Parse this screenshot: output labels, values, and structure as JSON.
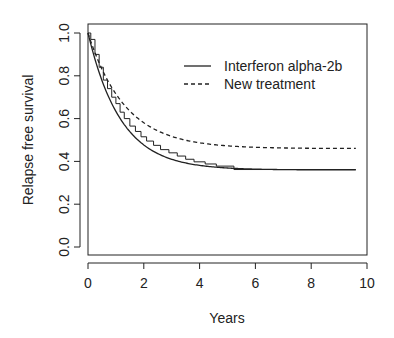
{
  "chart_data": {
    "type": "line",
    "title": "",
    "xlabel": "Years",
    "ylabel": "Relapse free survival",
    "xlim": [
      0,
      10
    ],
    "ylim": [
      0,
      1
    ],
    "x_ticks": [
      0,
      2,
      4,
      6,
      8,
      10
    ],
    "x_tick_labels": [
      "0",
      "2",
      "4",
      "6",
      "8",
      "10"
    ],
    "y_ticks": [
      0.0,
      0.2,
      0.4,
      0.6,
      0.8,
      1.0
    ],
    "y_tick_labels": [
      "0.0",
      "0.2",
      "0.4",
      "0.6",
      "0.8",
      "1.0"
    ],
    "grid": false,
    "legend_position": "top-right inside",
    "series": [
      {
        "name": "Interferon alpha-2b",
        "style": "solid",
        "model": "cure",
        "cure_fraction": 0.36,
        "rate": 0.85,
        "x": [
          0,
          1,
          2,
          3,
          4,
          5,
          6,
          7,
          8,
          9,
          9.6
        ],
        "values": [
          1.0,
          0.634,
          0.47,
          0.41,
          0.381,
          0.369,
          0.364,
          0.362,
          0.36,
          0.36,
          0.36
        ]
      },
      {
        "name": "New treatment",
        "style": "dashed",
        "model": "cure",
        "cure_fraction": 0.46,
        "rate": 0.75,
        "x": [
          0,
          1,
          2,
          3,
          4,
          5,
          6,
          7,
          8,
          9,
          9.6
        ],
        "values": [
          1.0,
          0.715,
          0.58,
          0.517,
          0.487,
          0.472,
          0.466,
          0.463,
          0.461,
          0.46,
          0.46
        ]
      },
      {
        "name": "Interferon alpha-2b (Kaplan-Meier)",
        "style": "step",
        "steps": [
          [
            0.0,
            1.0
          ],
          [
            0.1,
            0.97
          ],
          [
            0.25,
            0.9
          ],
          [
            0.4,
            0.84
          ],
          [
            0.55,
            0.78
          ],
          [
            0.7,
            0.74
          ],
          [
            0.85,
            0.7
          ],
          [
            1.0,
            0.67
          ],
          [
            1.15,
            0.63
          ],
          [
            1.3,
            0.6
          ],
          [
            1.5,
            0.565
          ],
          [
            1.7,
            0.54
          ],
          [
            1.9,
            0.515
          ],
          [
            2.1,
            0.495
          ],
          [
            2.35,
            0.475
          ],
          [
            2.6,
            0.455
          ],
          [
            2.9,
            0.44
          ],
          [
            3.2,
            0.425
          ],
          [
            3.5,
            0.41
          ],
          [
            3.8,
            0.398
          ],
          [
            4.2,
            0.388
          ],
          [
            4.6,
            0.378
          ],
          [
            5.23,
            0.362
          ],
          [
            9.6,
            0.362
          ]
        ]
      }
    ]
  },
  "legend": {
    "items": [
      {
        "label": "Interferon alpha-2b",
        "style": "solid"
      },
      {
        "label": "New treatment",
        "style": "dashed"
      }
    ]
  }
}
